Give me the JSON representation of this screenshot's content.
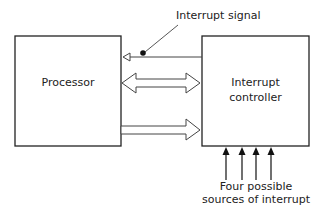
{
  "diagram": {
    "blocks": {
      "processor": {
        "label": "Processor"
      },
      "controller": {
        "label_line1": "Interrupt",
        "label_line2": "controller"
      }
    },
    "annotations": {
      "interrupt_signal": "Interrupt signal",
      "sources_line1": "Four possible",
      "sources_line2": "sources of interrupt"
    },
    "connections": [
      {
        "from": "controller",
        "to": "processor",
        "type": "signal-line",
        "label": "Interrupt signal"
      },
      {
        "from": "processor",
        "to": "controller",
        "type": "bidirectional-bus"
      },
      {
        "from": "processor",
        "to": "controller",
        "type": "unidirectional-bus"
      }
    ],
    "interrupt_sources_count": 4,
    "colors": {
      "line": "#222222",
      "background": "#ffffff"
    }
  }
}
